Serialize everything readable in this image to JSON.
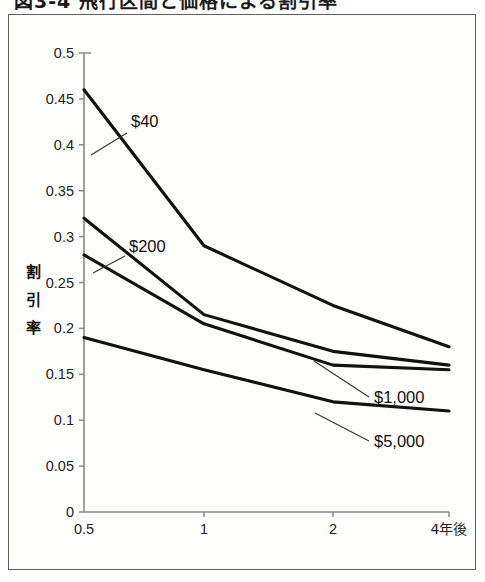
{
  "caption": {
    "text": "図3-4  飛行区間と価格による割引率"
  },
  "chart_data": {
    "type": "line",
    "title": "",
    "xlabel": "",
    "ylabel": "割引率",
    "ylabel_chars": [
      "割",
      "引",
      "率"
    ],
    "x": [
      0.5,
      1,
      2,
      4
    ],
    "xtick_labels": [
      "0.5",
      "1",
      "2",
      "4年後"
    ],
    "xlast_suffix": "年後",
    "ytick_labels": [
      "0",
      "0.05",
      "0.1",
      "0.15",
      "0.2",
      "0.25",
      "0.3",
      "0.35",
      "0.4",
      "0.45",
      "0.5"
    ],
    "ytick_values": [
      0,
      0.05,
      0.1,
      0.15,
      0.2,
      0.25,
      0.3,
      0.35,
      0.4,
      0.45,
      0.5
    ],
    "ylim": [
      0,
      0.5
    ],
    "grid": false,
    "legend_position": "inline-annotations",
    "line_color": "#111111",
    "axis_color": "#8a8a85",
    "series": [
      {
        "name": "$40",
        "label": "$40",
        "values": [
          0.46,
          0.29,
          0.225,
          0.18
        ]
      },
      {
        "name": "$200",
        "label": "$200",
        "values": [
          0.32,
          0.215,
          0.175,
          0.16
        ]
      },
      {
        "name": "$1,000",
        "label": "$1,000",
        "values": [
          0.28,
          0.205,
          0.16,
          0.155
        ]
      },
      {
        "name": "$5,000",
        "label": "$5,000",
        "values": [
          0.19,
          0.155,
          0.12,
          0.11
        ]
      }
    ],
    "annotations": [
      {
        "text": "$40",
        "x": 122,
        "y": 112,
        "leader_from": [
          118,
          118
        ],
        "leader_to": [
          82,
          140
        ]
      },
      {
        "text": "$200",
        "x": 120,
        "y": 237,
        "leader_from": [
          116,
          241
        ],
        "leader_to": [
          84,
          258
        ]
      },
      {
        "text": "$1,000",
        "x": 365,
        "y": 388,
        "leader_from": [
          360,
          382
        ],
        "leader_to": [
          305,
          346
        ]
      },
      {
        "text": "$5,000",
        "x": 365,
        "y": 432,
        "leader_from": [
          360,
          426
        ],
        "leader_to": [
          306,
          398
        ]
      }
    ]
  }
}
